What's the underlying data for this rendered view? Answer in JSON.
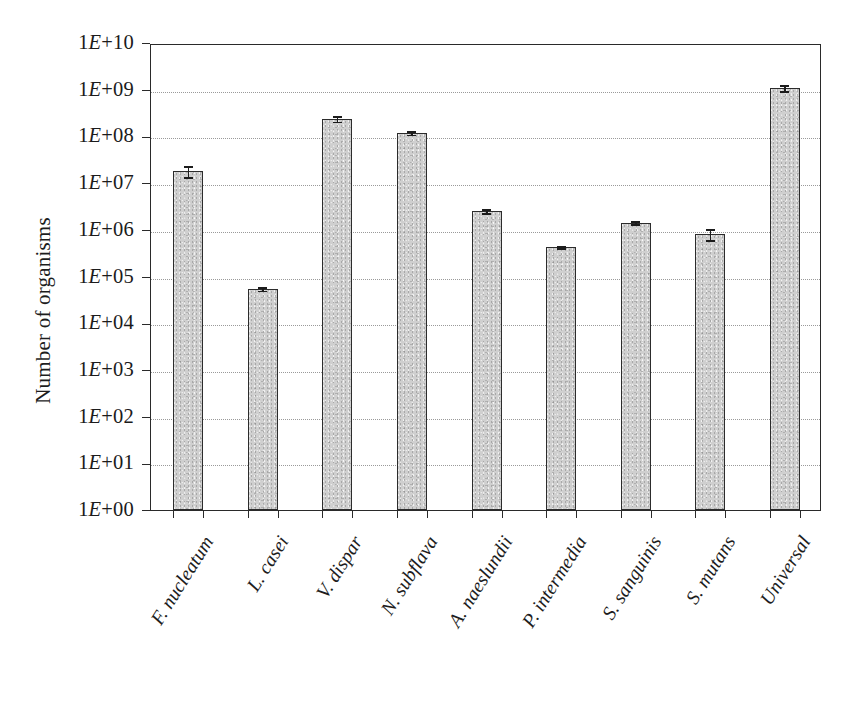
{
  "chart_data": {
    "type": "bar",
    "title": "",
    "xlabel": "",
    "ylabel": "Number of organisms",
    "yscale": "log",
    "ylim": [
      1,
      10000000000
    ],
    "grid": true,
    "legend": null,
    "ytick_labels": [
      "1E+10",
      "1E+09",
      "1E+08",
      "1E+07",
      "1E+06",
      "1E+05",
      "1E+04",
      "1E+03",
      "1E+02",
      "1E+01",
      "1E+00"
    ],
    "ytick_values": [
      10000000000,
      1000000000,
      100000000,
      10000000,
      1000000,
      100000,
      10000,
      1000,
      100,
      10,
      1
    ],
    "categories": [
      "F. nucleatum",
      "L. casei",
      "V. dispar",
      "N. subflava",
      "A. naeslundii",
      "P. intermedia",
      "S. sanguinis",
      "S. mutans",
      "Universal"
    ],
    "values": [
      18000000.0,
      55000.0,
      240000000.0,
      120000000.0,
      2500000.0,
      430000.0,
      1400000.0,
      800000.0,
      1100000000.0
    ],
    "value_labels": [
      "1.8E+07",
      "5.5E+04",
      "2.4E+08",
      "1.2E+08",
      "2.5E+06",
      "4.3E+05",
      "1.4E+06",
      "8.0E+05",
      "1.1E+09"
    ],
    "errors_low": [
      13000000.0,
      48000.0,
      200000000.0,
      105000000.0,
      2200000.0,
      390000.0,
      1250000.0,
      580000.0,
      900000000.0
    ],
    "errors_high": [
      24000000.0,
      62000.0,
      290000000.0,
      138000000.0,
      2900000.0,
      480000.0,
      1600000.0,
      1100000.0,
      1300000000.0
    ],
    "bar_color": "#cfcfcf",
    "bar_edge_color": "#2c2c2c",
    "grid_color": "#9a9a9a",
    "axis_color": "#2a2a2a"
  }
}
